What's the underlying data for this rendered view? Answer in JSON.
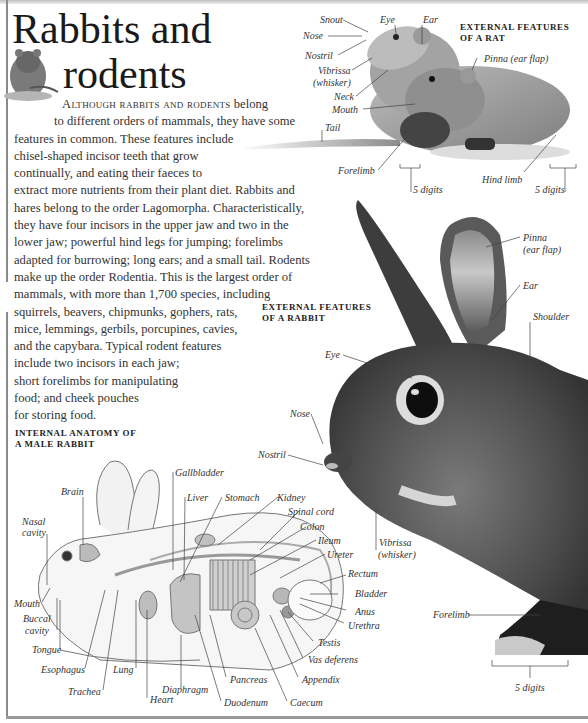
{
  "page": {
    "title_line1": "Rabbits and",
    "title_line2": "rodents",
    "intro": {
      "lead": "Although rabbits and rodents",
      "lines": [
        " belong",
        "to different orders of mammals, they have some",
        "features in common. These features include",
        "chisel-shaped incisor teeth that grow",
        "continually, and eating their faeces to",
        "extract more nutrients from their plant diet. Rabbits and",
        "hares belong to the order Lagomorpha. Characteristically,",
        "they have four incisors in the upper jaw and two in the",
        "lower jaw; powerful hind legs for jumping; forelimbs",
        "adapted for burrowing; long ears; and a small tail. Rodents",
        "make up the order Rodentia. This is the largest order of",
        "mammals, with more than 1,700 species, including",
        "squirrels, beavers, chipmunks, gophers, rats,",
        "mice, lemmings, gerbils, porcupines, cavies,",
        "and the capybara. Typical rodent features",
        "include two incisors in each jaw;",
        "short forelimbs for manipulating",
        "food; and cheek pouches",
        "for storing food."
      ]
    }
  },
  "rat_figure": {
    "heading_line1": "EXTERNAL FEATURES",
    "heading_line2": "OF A RAT",
    "labels": {
      "snout": "Snout",
      "eye": "Eye",
      "ear": "Ear",
      "nose": "Nose",
      "nostril": "Nostril",
      "vibrissa": "Vibrissa",
      "whisker": "(whisker)",
      "neck": "Neck",
      "mouth": "Mouth",
      "pinna": "Pinna (ear flap)",
      "tail": "Tail",
      "forelimb": "Forelimb",
      "hind_limb": "Hind limb",
      "digits_front": "5 digits",
      "digits_hind": "5 digits"
    }
  },
  "rabbit_figure": {
    "heading_line1": "EXTERNAL FEATURES",
    "heading_line2": "OF A RABBIT",
    "labels": {
      "pinna": "Pinna",
      "ear_flap": "(ear flap)",
      "ear": "Ear",
      "shoulder": "Shoulder",
      "eye": "Eye",
      "nose": "Nose",
      "nostril": "Nostril",
      "vibrissa": "Vibrissa",
      "whisker": "(whisker)",
      "forelimb": "Forelimb",
      "digits": "5 digits"
    }
  },
  "anatomy_figure": {
    "heading_line1": "INTERNAL ANATOMY OF",
    "heading_line2": "A MALE RABBIT",
    "labels": {
      "brain": "Brain",
      "nasal": "Nasal",
      "cavity": "cavity",
      "mouth": "Mouth",
      "buccal": "Buccal",
      "buccal_cavity": "cavity",
      "tongue": "Tongue",
      "esophagus": "Esophagus",
      "trachea": "Trachea",
      "lung": "Lung",
      "heart": "Heart",
      "diaphragm": "Diaphragm",
      "pancreas": "Pancreas",
      "duodenum": "Duodenum",
      "caecum": "Caecum",
      "appendix": "Appendix",
      "vas_deferens": "Vas deferens",
      "testis": "Testis",
      "urethra": "Urethra",
      "anus": "Anus",
      "bladder": "Bladder",
      "rectum": "Rectum",
      "ureter": "Ureter",
      "ileum": "Ileum",
      "colon": "Colon",
      "spinal_cord": "Spinal cord",
      "kidney": "Kidney",
      "stomach": "Stomach",
      "liver": "Liver",
      "gallbladder": "Gallbladder"
    }
  }
}
